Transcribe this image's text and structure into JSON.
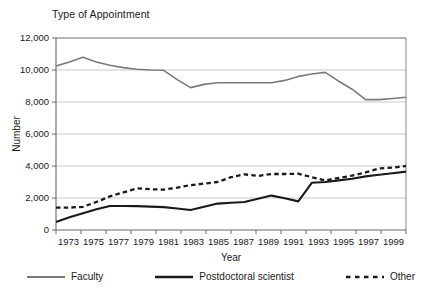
{
  "chart_data": {
    "type": "line",
    "title": "Type of Appointment",
    "xlabel": "Year",
    "ylabel": "Number",
    "grid": true,
    "legend_position": "bottom",
    "xlim": [
      1973,
      1999
    ],
    "ylim": [
      0,
      12000
    ],
    "ytick_labels": [
      "12,000",
      "10,000",
      "8,000",
      "6,000",
      "4,000",
      "2,000",
      "0"
    ],
    "ytick_values": [
      12000,
      10000,
      8000,
      6000,
      4000,
      2000,
      0
    ],
    "xtick_labels": [
      "1973",
      "1975",
      "1977",
      "1979",
      "1981",
      "1983",
      "1985",
      "1987",
      "1989",
      "1991",
      "1993",
      "1995",
      "1997",
      "1999"
    ],
    "x": [
      1973,
      1974,
      1975,
      1976,
      1977,
      1978,
      1979,
      1980,
      1981,
      1982,
      1983,
      1984,
      1985,
      1986,
      1987,
      1988,
      1989,
      1990,
      1991,
      1992,
      1993,
      1994,
      1995,
      1996,
      1997,
      1998,
      1999
    ],
    "series": [
      {
        "name": "Faculty",
        "color": "#7a7a7a",
        "width": 1.6,
        "style": "solid",
        "values": [
          10250,
          10500,
          10800,
          10500,
          10300,
          10150,
          10050,
          10000,
          9980,
          9400,
          8900,
          9100,
          9200,
          9200,
          9200,
          9200,
          9200,
          9350,
          9600,
          9750,
          9850,
          9300,
          8800,
          8150,
          8150,
          8220,
          8300
        ]
      },
      {
        "name": "Postdoctoral scientist",
        "color": "#1a1a1a",
        "width": 2.1,
        "style": "solid",
        "values": [
          500,
          800,
          1050,
          1300,
          1500,
          1500,
          1490,
          1460,
          1430,
          1340,
          1250,
          1450,
          1650,
          1700,
          1750,
          1950,
          2150,
          1980,
          1790,
          2950,
          3000,
          3100,
          3200,
          3350,
          3450,
          3550,
          3650
        ]
      },
      {
        "name": "Other",
        "color": "#1a1a1a",
        "width": 2.3,
        "style": "dashed",
        "values": [
          1400,
          1400,
          1450,
          1750,
          2100,
          2350,
          2600,
          2550,
          2520,
          2650,
          2800,
          2900,
          3000,
          3300,
          3480,
          3380,
          3500,
          3500,
          3520,
          3300,
          3100,
          3250,
          3400,
          3600,
          3850,
          3900,
          4000
        ]
      }
    ]
  },
  "legend": {
    "items": [
      {
        "label": "Faculty"
      },
      {
        "label": "Postdoctoral scientist"
      },
      {
        "label": "Other"
      }
    ]
  }
}
